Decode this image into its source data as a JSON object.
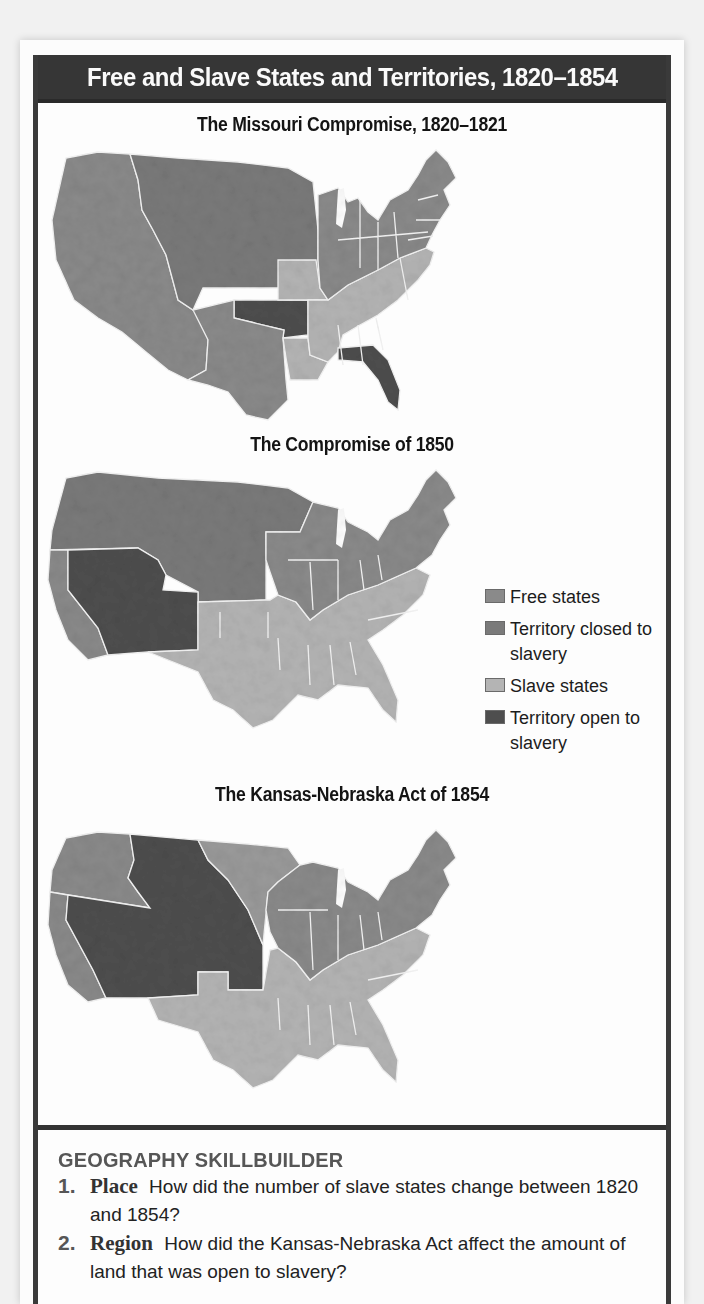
{
  "title": "Free and Slave States and Territories, 1820–1854",
  "legend": {
    "items": [
      {
        "label": "Free states",
        "color": "#8a8a8a"
      },
      {
        "label": "Territory closed to slavery",
        "color": "#7a7a7a"
      },
      {
        "label": "Slave states",
        "color": "#b4b4b4"
      },
      {
        "label": "Territory open to slavery",
        "color": "#4e4e4e"
      }
    ]
  },
  "maps": [
    {
      "heading": "The Missouri Compromise, 1820–1821"
    },
    {
      "heading": "The Compromise of 1850"
    },
    {
      "heading": "The Kansas-Nebraska Act of 1854"
    }
  ],
  "skillbuilder": {
    "heading": "GEOGRAPHY SKILLBUILDER",
    "questions": [
      {
        "number": "1.",
        "theme": "Place",
        "text": "How did the number of slave states change between 1820 and 1854?"
      },
      {
        "number": "2.",
        "theme": "Region",
        "text": "How did the Kansas-Nebraska Act affect the amount of land that was open to slavery?"
      }
    ]
  },
  "colors": {
    "free_states": "#8a8a8a",
    "territory_closed": "#7a7a7a",
    "slave_states": "#b4b4b4",
    "territory_open": "#4e4e4e",
    "title_bar": "#363636"
  }
}
